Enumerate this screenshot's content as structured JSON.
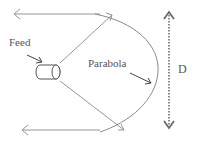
{
  "diagram": {
    "type": "parabolic-antenna",
    "labels": {
      "feed": "Feed",
      "parabola": "Parabola",
      "diameter": "D"
    },
    "colors": {
      "line": "#8a8a8a",
      "dark_arrow": "#444444",
      "dotted": "#8a8a8a",
      "text": "#555555"
    }
  }
}
